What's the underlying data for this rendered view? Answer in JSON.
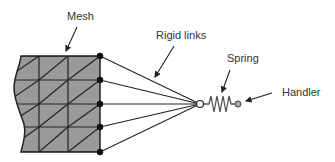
{
  "labels": {
    "mesh": "Mesh",
    "rigid_links": "Rigid links",
    "spring": "Spring",
    "handler": "Handler"
  },
  "colors": {
    "mesh_fill": "#9a9a9a",
    "stroke": "#222222",
    "text": "#333333",
    "spring": "#555555",
    "handler_fill": "#aaaaaa"
  },
  "geometry": {
    "mesh_outline": "M21,56 L100,56 L100,152 L21,152 C24,140 26,132 24,124 C20,112 14,100 14,88 C14,76 20,66 21,56 Z",
    "mesh_cols_x": [
      39,
      68,
      100
    ],
    "mesh_rows_y": [
      56,
      80,
      104,
      127,
      152
    ],
    "mesh_left_x": 16,
    "nodes": [
      [
        100,
        56
      ],
      [
        100,
        80
      ],
      [
        100,
        104
      ],
      [
        100,
        127
      ],
      [
        100,
        152
      ]
    ],
    "hub": [
      200,
      104
    ],
    "spring_path": "M204,104 L209,104 L211,96 L214,112 L217,96 L220,112 L223,96 L226,112 L229,96 L231,104 L235,104",
    "handler": [
      238,
      104
    ],
    "arrows": [
      {
        "name": "mesh-arrow",
        "from": [
          77,
          27
        ],
        "to": [
          66,
          51
        ]
      },
      {
        "name": "rigid-links-arrow",
        "from": [
          174,
          46
        ],
        "to": [
          155,
          77
        ]
      },
      {
        "name": "spring-arrow",
        "from": [
          230,
          70
        ],
        "to": [
          222,
          92
        ]
      },
      {
        "name": "handler-arrow",
        "from": [
          272,
          93
        ],
        "to": [
          246,
          101
        ]
      }
    ]
  }
}
